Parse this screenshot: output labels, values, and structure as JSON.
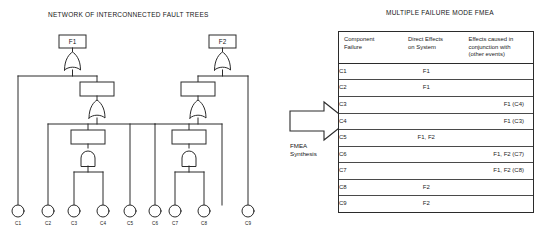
{
  "left_panel": {
    "title": "NETWORK OF INTERCONNECTED FAULT TREES",
    "top_events": [
      {
        "id": "F1",
        "label": "F1"
      },
      {
        "id": "F2",
        "label": "F2"
      }
    ],
    "basic_events": [
      {
        "id": "C1",
        "label": "C1"
      },
      {
        "id": "C2",
        "label": "C2"
      },
      {
        "id": "C3",
        "label": "C3"
      },
      {
        "id": "C4",
        "label": "C4"
      },
      {
        "id": "C5",
        "label": "C5"
      },
      {
        "id": "C6",
        "label": "C6"
      },
      {
        "id": "C7",
        "label": "C7"
      },
      {
        "id": "C8",
        "label": "C8"
      },
      {
        "id": "C9",
        "label": "C9"
      }
    ],
    "gates": [
      {
        "id": "G1",
        "type": "or",
        "output": "F1"
      },
      {
        "id": "G2",
        "type": "or",
        "output": "G1"
      },
      {
        "id": "G3",
        "type": "and",
        "output": "G2",
        "inputs": [
          "C3",
          "C4"
        ]
      },
      {
        "id": "G4",
        "type": "or",
        "output": "F2"
      },
      {
        "id": "G5",
        "type": "or",
        "output": "G4"
      },
      {
        "id": "G6",
        "type": "and",
        "output": "G5",
        "inputs": [
          "C6",
          "C7"
        ]
      }
    ]
  },
  "transform": {
    "arrow_icon": "right-arrow-icon",
    "label_line1": "FMEA",
    "label_line2": "Synthesis"
  },
  "right_panel": {
    "title": "MULTIPLE FAILURE MODE FMEA",
    "table": {
      "headers": [
        "Component\nFailure",
        "Direct Effects\non System",
        "Effects caused in\nconjunction with\n(other events)"
      ],
      "header_lines": [
        [
          "Component",
          "Failure"
        ],
        [
          "Direct Effects",
          "on System"
        ],
        [
          "Effects caused in",
          "conjunction with",
          "(other events)"
        ]
      ],
      "rows": [
        {
          "component": "C1",
          "direct": "F1",
          "conjunction": ""
        },
        {
          "component": "C2",
          "direct": "F1",
          "conjunction": ""
        },
        {
          "component": "C3",
          "direct": "",
          "conjunction": "F1 (C4)"
        },
        {
          "component": "C4",
          "direct": "",
          "conjunction": "F1 (C3)"
        },
        {
          "component": "C5",
          "direct": "F1, F2",
          "conjunction": ""
        },
        {
          "component": "C6",
          "direct": "",
          "conjunction": "F1, F2  (C7)"
        },
        {
          "component": "C7",
          "direct": "",
          "conjunction": "F1, F2  (C8)"
        },
        {
          "component": "C8",
          "direct": "F2",
          "conjunction": ""
        },
        {
          "component": "C9",
          "direct": "F2",
          "conjunction": ""
        }
      ]
    }
  },
  "colors": {
    "line": "#2b2b2b",
    "text": "#161616",
    "background": "#ffffff"
  }
}
